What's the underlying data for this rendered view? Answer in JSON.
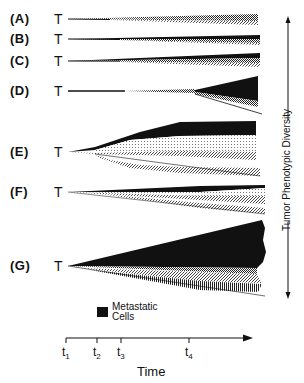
{
  "figure": {
    "rows": [
      {
        "id": "A",
        "label": "(A)",
        "start": "T",
        "y": 19
      },
      {
        "id": "B",
        "label": "(B)",
        "start": "T",
        "y": 39
      },
      {
        "id": "C",
        "label": "(C)",
        "start": "T",
        "y": 61
      },
      {
        "id": "D",
        "label": "(D)",
        "start": "T",
        "y": 91
      },
      {
        "id": "E",
        "label": "(E)",
        "start": "T",
        "y": 152
      },
      {
        "id": "F",
        "label": "(F)",
        "start": "T",
        "y": 192
      },
      {
        "id": "G",
        "label": "(G)",
        "start": "T",
        "y": 266
      }
    ],
    "vertical_axis_label": "Tumor Phenotypic Diversity",
    "legend": {
      "swatch_color": "#111111",
      "line1": "Metastatic",
      "line2": "Cells"
    },
    "time_axis": {
      "label": "Time",
      "ticks": [
        {
          "base": "t",
          "sub": "1",
          "x": 66
        },
        {
          "base": "t",
          "sub": "2",
          "x": 97
        },
        {
          "base": "t",
          "sub": "3",
          "x": 121
        },
        {
          "base": "t",
          "sub": "4",
          "x": 189
        }
      ]
    },
    "colors": {
      "ink": "#111111",
      "background": "#ffffff"
    }
  }
}
